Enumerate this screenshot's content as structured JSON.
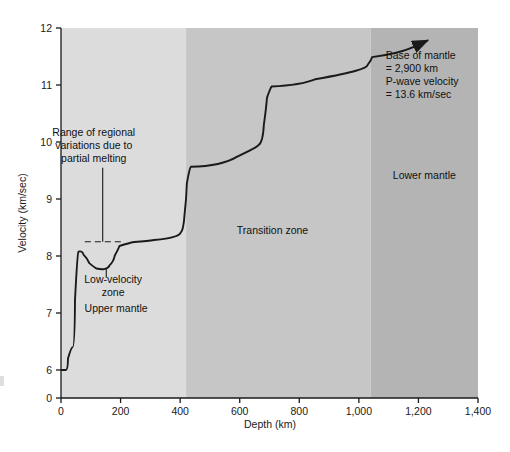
{
  "chart_data": {
    "type": "line",
    "title": "",
    "xlabel": "Depth (km)",
    "ylabel": "Velocity (km/sec)",
    "xlim": [
      0,
      1400
    ],
    "ylim": [
      0,
      12
    ],
    "grid": false,
    "legend": "none",
    "y_axis_note": "Axis has a break between 0 and 6; 6-12 is linear",
    "xticks": [
      0,
      200,
      400,
      600,
      800,
      1000,
      1200,
      1400
    ],
    "xtick_labels": [
      "0",
      "200",
      "400",
      "600",
      "800",
      "1,000",
      "1,200",
      "1,400"
    ],
    "yticks": [
      0,
      6,
      7,
      8,
      9,
      10,
      11,
      12
    ],
    "ytick_labels": [
      "0",
      "6",
      "7",
      "8",
      "9",
      "10",
      "11",
      "12"
    ],
    "series": [
      {
        "name": "P-wave velocity",
        "points": [
          [
            0,
            6.0
          ],
          [
            22,
            6.0
          ],
          [
            24,
            6.4
          ],
          [
            44,
            6.4
          ],
          [
            48,
            8.05
          ],
          [
            62,
            8.1
          ],
          [
            80,
            7.95
          ],
          [
            100,
            7.8
          ],
          [
            125,
            7.76
          ],
          [
            150,
            7.78
          ],
          [
            168,
            7.9
          ],
          [
            185,
            8.12
          ],
          [
            200,
            8.23
          ],
          [
            260,
            8.26
          ],
          [
            330,
            8.3
          ],
          [
            390,
            8.36
          ],
          [
            405,
            8.45
          ],
          [
            418,
            9.0
          ],
          [
            424,
            9.55
          ],
          [
            440,
            9.58
          ],
          [
            640,
            9.9
          ],
          [
            672,
            10.0
          ],
          [
            684,
            10.6
          ],
          [
            694,
            10.95
          ],
          [
            712,
            11.0
          ],
          [
            900,
            11.2
          ],
          [
            1020,
            11.3
          ],
          [
            1034,
            11.42
          ],
          [
            1048,
            11.56
          ],
          [
            1230,
            11.78
          ]
        ],
        "end_arrow": true
      }
    ],
    "reference_lines": [
      {
        "name": "range-of-regional-variations",
        "style": "dashed",
        "y": 8.25,
        "x_start": 80,
        "x_end": 213
      }
    ],
    "bands": [
      {
        "name": "upper-mantle",
        "x_start": 0,
        "x_end": 420,
        "color": "#dcdcdc"
      },
      {
        "name": "transition-zone",
        "x_start": 420,
        "x_end": 1040,
        "color": "#c6c6c6"
      },
      {
        "name": "lower-mantle",
        "x_start": 1040,
        "x_end": 1400,
        "color": "#b4b4b4"
      }
    ],
    "zone_labels": [
      {
        "name": "upper-mantle-label",
        "text": "Upper mantle",
        "x": 185,
        "y": 7.02
      },
      {
        "name": "low-velocity-zone-label",
        "text": "Low-velocity\nzone",
        "x": 175,
        "y": 7.52
      },
      {
        "name": "transition-zone-label",
        "text": "Transition zone",
        "x": 710,
        "y": 8.38
      },
      {
        "name": "lower-mantle-label",
        "text": "Lower mantle",
        "x": 1220,
        "y": 9.35
      }
    ],
    "annotations": [
      {
        "name": "regional-variations-annotation",
        "lines": [
          "Range of regional",
          "variations due to",
          "partial melting"
        ],
        "x": 110,
        "y": 10.1,
        "leader": {
          "from_y": 9.55,
          "to_y": 8.25,
          "x": 140
        }
      },
      {
        "name": "base-of-mantle-annotation",
        "lines": [
          "Base of mantle",
          "= 2,900 km",
          "P-wave velocity",
          "= 13.6 km/sec"
        ],
        "x": 1090,
        "y": 11.45
      }
    ]
  },
  "axes": {
    "xlabel": "Depth (km)",
    "ylabel": "Velocity (km/sec)"
  }
}
